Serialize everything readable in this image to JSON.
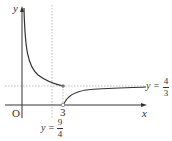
{
  "axes": {
    "x_label": "x",
    "y_label": "y",
    "origin_label": "O"
  },
  "ticks": {
    "x_tick": "3"
  },
  "asymptotes": {
    "horizontal": {
      "prefix": "y =",
      "num": "4",
      "den": "3"
    },
    "vertical": {
      "prefix": "y =",
      "num": "9",
      "den": "4"
    }
  },
  "colors": {
    "curve": "#333333",
    "axis": "#333333",
    "dotted": "#999999",
    "point": "#777777"
  }
}
